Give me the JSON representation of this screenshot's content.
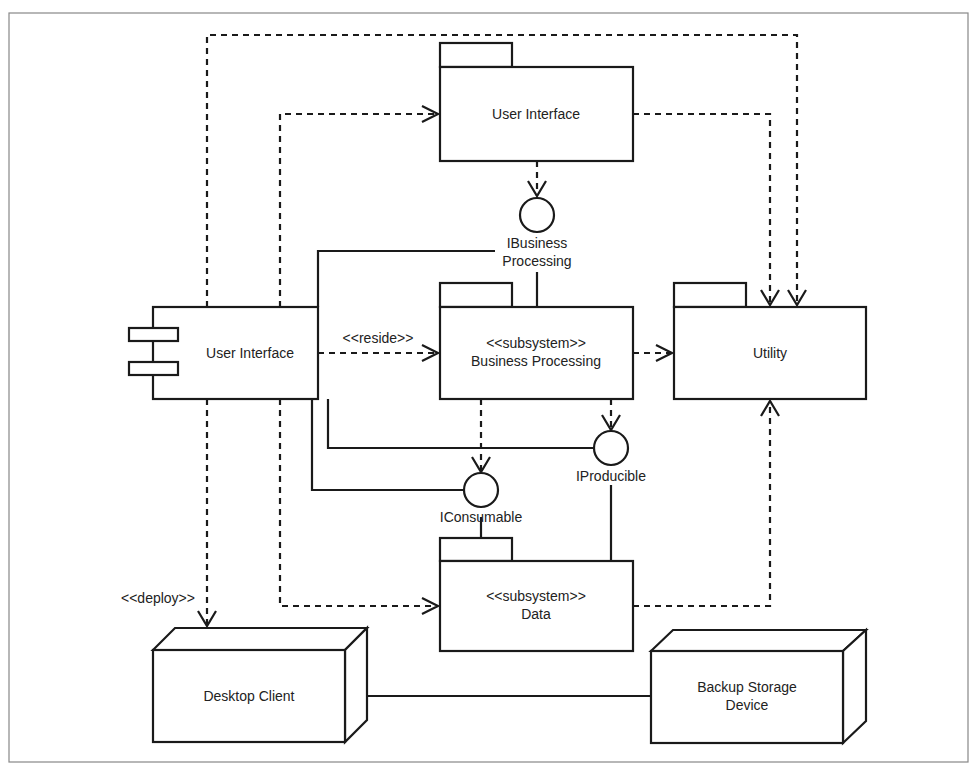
{
  "diagram": {
    "type": "UML component/deployment diagram",
    "packages": {
      "user_interface_pkg": {
        "label": "User Interface"
      },
      "business_processing_pkg": {
        "stereotype": "<<subsystem>>",
        "label": "Business Processing"
      },
      "utility_pkg": {
        "label": "Utility"
      },
      "data_pkg": {
        "stereotype": "<<subsystem>>",
        "label": "Data"
      }
    },
    "components": {
      "user_interface_component": {
        "label": "User Interface"
      }
    },
    "interfaces": {
      "ibusiness": {
        "line1": "IBusiness",
        "line2": "Processing"
      },
      "iconsumable": {
        "label": "IConsumable"
      },
      "iproducible": {
        "label": "IProducible"
      }
    },
    "nodes": {
      "desktop_client": {
        "label": "Desktop Client"
      },
      "backup_storage": {
        "line1": "Backup Storage",
        "line2": "Device"
      }
    },
    "relationship_labels": {
      "reside": "<<reside>>",
      "deploy": "<<deploy>>"
    },
    "colors": {
      "line": "#1a1a1a",
      "background": "#ffffff",
      "frame": "#888888"
    }
  }
}
